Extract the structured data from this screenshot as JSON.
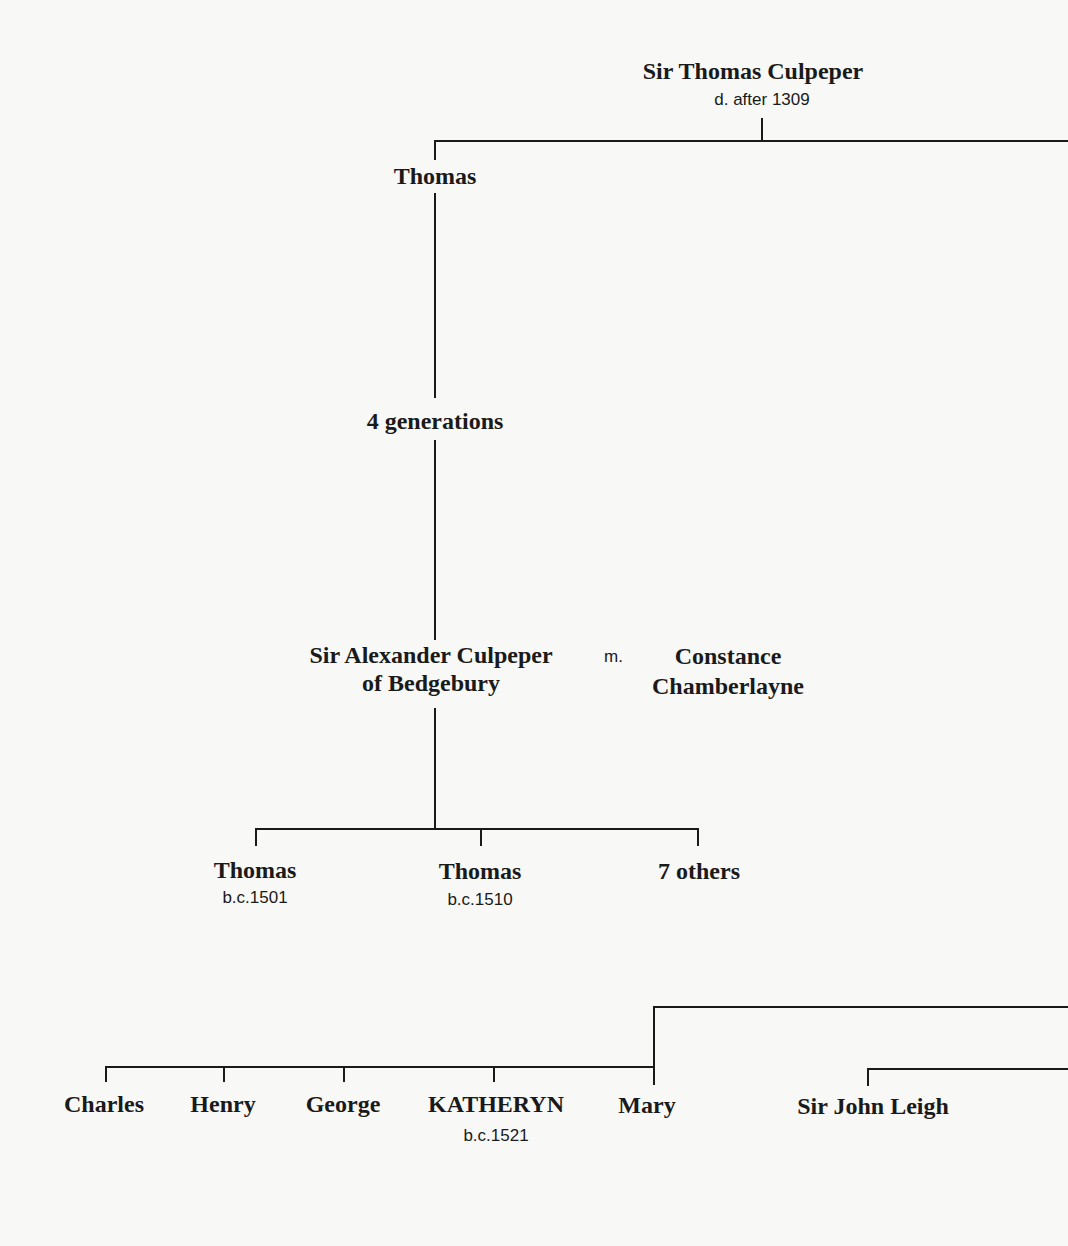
{
  "tree": {
    "root": {
      "name": "Sir Thomas Culpeper",
      "note": "d. after 1309"
    },
    "gen1": {
      "name": "Thomas"
    },
    "gap": {
      "label": "4 generations"
    },
    "couple": {
      "husband_line1": "Sir Alexander Culpeper",
      "husband_line2": "of Bedgebury",
      "marriage": "m.",
      "wife_line1": "Constance",
      "wife_line2": "Chamberlayne"
    },
    "children": [
      {
        "name": "Thomas",
        "note": "b.c.1501"
      },
      {
        "name": "Thomas",
        "note": "b.c.1510"
      },
      {
        "name": "7 others"
      }
    ],
    "grandchildren": [
      {
        "name": "Charles"
      },
      {
        "name": "Henry"
      },
      {
        "name": "George"
      },
      {
        "name": "KATHERYN",
        "note": "b.c.1521"
      },
      {
        "name": "Mary"
      }
    ],
    "other": {
      "name": "Sir John Leigh"
    }
  }
}
